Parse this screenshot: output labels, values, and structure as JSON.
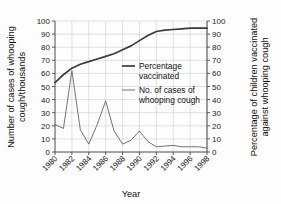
{
  "chart_data": {
    "type": "line",
    "title": "",
    "xlabel": "Year",
    "ylabel": "Number of cases of whooping cough/thousands",
    "ylabel_right": "Percentage of children vaccinated against whooping cough",
    "xlim": [
      1980,
      1998
    ],
    "ylim": [
      0,
      100
    ],
    "ylim_right": [
      0,
      100
    ],
    "grid": true,
    "legend_position": "inside-center-right",
    "x_tick_labels": [
      "1980",
      "1982",
      "1984",
      "1986",
      "1988",
      "1990",
      "1992",
      "1994",
      "1996",
      "1998"
    ],
    "x_ticks": [
      1980,
      1982,
      1984,
      1986,
      1988,
      1990,
      1992,
      1994,
      1996,
      1998
    ],
    "y_tick_labels": [
      "0",
      "10",
      "20",
      "30",
      "40",
      "50",
      "60",
      "70",
      "80",
      "90",
      "100"
    ],
    "y_ticks": [
      0,
      10,
      20,
      30,
      40,
      50,
      60,
      70,
      80,
      90,
      100
    ],
    "y_tick_labels_right": [
      "0",
      "10",
      "20",
      "30",
      "40",
      "50",
      "60",
      "70",
      "80",
      "90",
      "100"
    ],
    "y_ticks_right": [
      0,
      10,
      20,
      30,
      40,
      50,
      60,
      70,
      80,
      90,
      100
    ],
    "x": [
      1980,
      1981,
      1982,
      1983,
      1984,
      1985,
      1986,
      1987,
      1988,
      1989,
      1990,
      1991,
      1992,
      1993,
      1994,
      1995,
      1996,
      1997,
      1998
    ],
    "series": [
      {
        "name": "Percentage vaccinated",
        "axis": "right",
        "color": "#3a3a3a",
        "line_width": "thick",
        "values": [
          53,
          59,
          64,
          67,
          69,
          71,
          73,
          75,
          78,
          81,
          85,
          89,
          92,
          93,
          93.5,
          94,
          94.5,
          94.5,
          94.5
        ]
      },
      {
        "name": "No. of cases of whooping cough",
        "axis": "left",
        "color": "#5a5a5a",
        "line_width": "thin",
        "values": [
          21,
          18,
          62,
          17,
          6,
          21,
          39,
          16,
          6,
          9,
          16,
          8,
          4,
          4.5,
          5,
          4,
          4,
          4,
          3
        ]
      }
    ],
    "legend": [
      {
        "label_line1": "Percentage",
        "label_line2": "vaccinated",
        "style": "thick"
      },
      {
        "label_line1": "No. of cases of",
        "label_line2": "whooping cough",
        "style": "thin"
      }
    ]
  },
  "axes": {
    "left_title_line1": "Number of cases of whooping",
    "left_title_line2": "cough/thousands",
    "right_title_line1": "Percentage of children vaccinated",
    "right_title_line2": "against whooping cough",
    "x_title": "Year"
  }
}
